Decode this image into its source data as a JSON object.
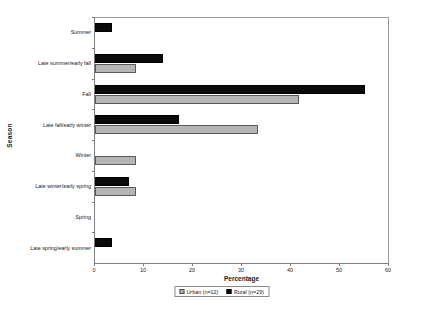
{
  "chart_data": {
    "type": "bar",
    "orientation": "horizontal",
    "title": "",
    "xlabel": "Percentage",
    "ylabel": "Season",
    "xlim": [
      0,
      60
    ],
    "xticks": [
      0,
      10,
      20,
      30,
      40,
      50,
      60
    ],
    "xtick_labels": [
      "0",
      "10",
      "20",
      "30",
      "40",
      "50",
      "60"
    ],
    "grid": false,
    "legend_position": "bottom-center",
    "categories": [
      "Summer",
      "Late summer/early fall",
      "Fall",
      "Late fall/early winter",
      "Winter",
      "Late winter/early spring",
      "Spring",
      "Late spring/early summer"
    ],
    "series": [
      {
        "name": "Urban (n=12)",
        "short_name": "Urban",
        "n": 12,
        "color": "#b5b5b5",
        "values": [
          0,
          8.3,
          41.7,
          33.3,
          8.3,
          8.3,
          0,
          0
        ]
      },
      {
        "name": "Rural (n=29)",
        "short_name": "Rural",
        "n": 29,
        "color": "#0a0a0a",
        "values": [
          3.4,
          13.8,
          55.2,
          17.2,
          0,
          6.9,
          0,
          3.4
        ]
      }
    ]
  },
  "legend": {
    "entries": [
      {
        "label": "Urban (n=12)",
        "swatch": "urban"
      },
      {
        "label": "Rural (n=29)",
        "swatch": "rural"
      }
    ]
  }
}
